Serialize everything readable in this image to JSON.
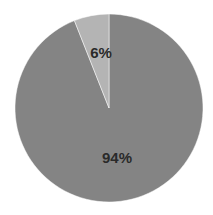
{
  "chart_data": {
    "type": "pie",
    "title": "",
    "categories": [
      "Segment A",
      "Segment B"
    ],
    "values": [
      94,
      6
    ],
    "labels": [
      "94%",
      "6%"
    ],
    "colors": [
      "#848484",
      "#b4b4b4"
    ],
    "legend": "none",
    "start_angle_deg_clockwise_from_top": 0
  }
}
